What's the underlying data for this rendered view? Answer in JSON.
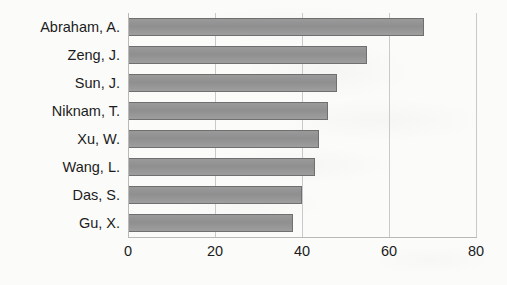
{
  "chart_data": {
    "type": "bar",
    "orientation": "horizontal",
    "title": "",
    "subtitle": "",
    "xlabel": "",
    "ylabel": "",
    "categories": [
      "Abraham, A.",
      "Zeng, J.",
      "Sun, J.",
      "Niknam, T.",
      "Xu, W.",
      "Wang, L.",
      "Das, S.",
      "Gu, X."
    ],
    "values": [
      68,
      55,
      48,
      46,
      44,
      43,
      40,
      38
    ],
    "xlim": [
      0,
      80
    ],
    "xticks": [
      0,
      20,
      40,
      60,
      80
    ],
    "xtick_labels": [
      "0",
      "20",
      "40",
      "60",
      "80"
    ],
    "grid": true,
    "grid_axis": "x",
    "legend": false,
    "legend_position": "none",
    "series": [
      {
        "name": "",
        "values": [
          68,
          55,
          48,
          46,
          44,
          43,
          40,
          38
        ]
      }
    ],
    "bar_color": "#969696",
    "bar_border_color": "#6f6f6f",
    "gridline_color": "#c9c9c9",
    "axis_color": "#b9b9b9",
    "text_color": "#1c1c1c",
    "background_color": "#fbfbfa"
  }
}
